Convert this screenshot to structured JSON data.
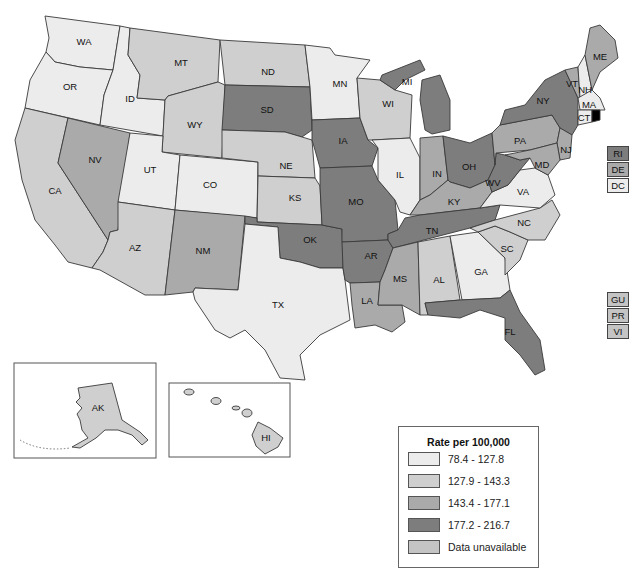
{
  "legend": {
    "title": "Rate per 100,000",
    "items": [
      {
        "label": "78.4 - 127.8",
        "color": "#ececec",
        "class": "c1"
      },
      {
        "label": "127.9 - 143.3",
        "color": "#cfcfcf",
        "class": "c2"
      },
      {
        "label": "143.4 - 177.1",
        "color": "#aaaaaa",
        "class": "c3"
      },
      {
        "label": "177.2 - 216.7",
        "color": "#7d7d7d",
        "class": "c4"
      },
      {
        "label": "Data unavailable",
        "color": "#c4c4c4",
        "class": "c5"
      }
    ]
  },
  "states": {
    "WA": {
      "label": "WA",
      "class": "c1"
    },
    "OR": {
      "label": "OR",
      "class": "c1"
    },
    "ID": {
      "label": "ID",
      "class": "c1"
    },
    "MT": {
      "label": "MT",
      "class": "c2"
    },
    "WY": {
      "label": "WY",
      "class": "c2"
    },
    "CA": {
      "label": "CA",
      "class": "c2"
    },
    "NV": {
      "label": "NV",
      "class": "c3"
    },
    "UT": {
      "label": "UT",
      "class": "c1"
    },
    "CO": {
      "label": "CO",
      "class": "c1"
    },
    "AZ": {
      "label": "AZ",
      "class": "c2"
    },
    "NM": {
      "label": "NM",
      "class": "c3"
    },
    "ND": {
      "label": "ND",
      "class": "c2"
    },
    "SD": {
      "label": "SD",
      "class": "c4"
    },
    "NE": {
      "label": "NE",
      "class": "c2"
    },
    "KS": {
      "label": "KS",
      "class": "c2"
    },
    "OK": {
      "label": "OK",
      "class": "c4"
    },
    "TX": {
      "label": "TX",
      "class": "c1"
    },
    "MN": {
      "label": "MN",
      "class": "c1"
    },
    "IA": {
      "label": "IA",
      "class": "c4"
    },
    "MO": {
      "label": "MO",
      "class": "c4"
    },
    "AR": {
      "label": "AR",
      "class": "c4"
    },
    "LA": {
      "label": "LA",
      "class": "c3"
    },
    "WI": {
      "label": "WI",
      "class": "c2"
    },
    "IL": {
      "label": "IL",
      "class": "c1"
    },
    "MI": {
      "label": "MI",
      "class": "c4"
    },
    "IN": {
      "label": "IN",
      "class": "c3"
    },
    "OH": {
      "label": "OH",
      "class": "c4"
    },
    "KY": {
      "label": "KY",
      "class": "c3"
    },
    "TN": {
      "label": "TN",
      "class": "c4"
    },
    "MS": {
      "label": "MS",
      "class": "c3"
    },
    "AL": {
      "label": "AL",
      "class": "c2"
    },
    "GA": {
      "label": "GA",
      "class": "c1"
    },
    "FL": {
      "label": "FL",
      "class": "c4"
    },
    "SC": {
      "label": "SC",
      "class": "c2"
    },
    "NC": {
      "label": "NC",
      "class": "c2"
    },
    "VA": {
      "label": "VA",
      "class": "c1"
    },
    "WV": {
      "label": "WV",
      "class": "c4"
    },
    "PA": {
      "label": "PA",
      "class": "c3"
    },
    "NY": {
      "label": "NY",
      "class": "c4"
    },
    "NJ": {
      "label": "NJ",
      "class": "c3"
    },
    "MD": {
      "label": "MD",
      "class": "c3"
    },
    "VT": {
      "label": "VT",
      "class": "c3"
    },
    "NH": {
      "label": "NH",
      "class": "c1"
    },
    "ME": {
      "label": "ME",
      "class": "c3"
    },
    "MA": {
      "label": "MA",
      "class": "c1"
    },
    "CT": {
      "label": "CT",
      "class": "c1"
    },
    "AK": {
      "label": "AK",
      "class": "c2"
    },
    "HI": {
      "label": "HI",
      "class": "c2"
    }
  },
  "small_states": [
    {
      "label": "RI",
      "class": "c4"
    },
    {
      "label": "DE",
      "class": "c3"
    },
    {
      "label": "DC",
      "class": "c1"
    }
  ],
  "territories": [
    {
      "label": "GU",
      "class": "c5"
    },
    {
      "label": "PR",
      "class": "c5"
    },
    {
      "label": "VI",
      "class": "c5"
    }
  ]
}
